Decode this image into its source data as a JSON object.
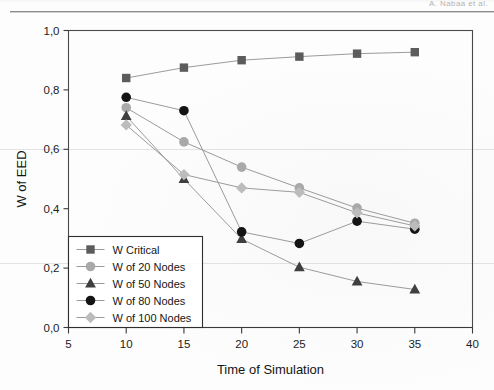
{
  "page": {
    "running_head": "A. Nabaa et al."
  },
  "chart_data": {
    "type": "line",
    "title": "",
    "xlabel": "Time of Simulation",
    "ylabel": "W of EED",
    "xlim": [
      5,
      40
    ],
    "ylim": [
      0.0,
      1.0
    ],
    "xticks": [
      5,
      10,
      15,
      20,
      25,
      30,
      35,
      40
    ],
    "xtick_labels": [
      "5",
      "10",
      "15",
      "20",
      "25",
      "30",
      "35",
      "40"
    ],
    "yticks": [
      0.0,
      0.2,
      0.4,
      0.6,
      0.8,
      1.0
    ],
    "ytick_labels": [
      "0,0",
      "0,2",
      "0,4",
      "0,6",
      "0,8",
      "1,0"
    ],
    "grid": false,
    "legend_position": "lower left",
    "x": [
      10,
      15,
      20,
      25,
      30,
      35
    ],
    "series": [
      {
        "name": "W Critical",
        "marker": "square",
        "color": "#5c5c5c",
        "values": [
          0.84,
          0.875,
          0.9,
          0.912,
          0.922,
          0.927
        ]
      },
      {
        "name": "W of 20 Nodes",
        "marker": "circle",
        "color": "#a9a9a9",
        "values": [
          0.74,
          0.625,
          0.54,
          0.47,
          0.402,
          0.351
        ]
      },
      {
        "name": "W of 50 Nodes",
        "marker": "triangle",
        "color": "#3f3f3f",
        "values": [
          0.712,
          0.5,
          0.298,
          0.203,
          0.155,
          0.128
        ]
      },
      {
        "name": "W of 80 Nodes",
        "marker": "circle",
        "color": "#141414",
        "values": [
          0.775,
          0.73,
          0.322,
          0.283,
          0.358,
          0.331
        ]
      },
      {
        "name": "W of 100 Nodes",
        "marker": "diamond",
        "color": "#bcbcbc",
        "values": [
          0.682,
          0.515,
          0.47,
          0.455,
          0.386,
          0.342
        ]
      }
    ]
  }
}
